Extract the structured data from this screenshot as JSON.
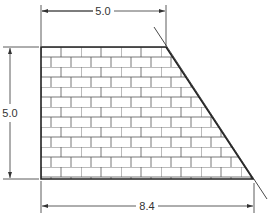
{
  "diagram": {
    "type": "technical-drawing",
    "shape": "trapezoid with brick hatch",
    "dimensions": {
      "top": "5.0",
      "left": "5.0",
      "bottom": "8.4"
    },
    "colors": {
      "outline": "#222222",
      "brick_line": "#555555",
      "dimension_line": "#333333",
      "background": "#ffffff"
    }
  }
}
